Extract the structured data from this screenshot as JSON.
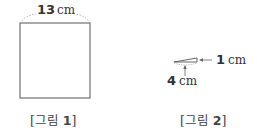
{
  "figure1": {
    "width_label_num": "13",
    "width_label_unit": "cm",
    "caption_open": "[그림 ",
    "caption_num": "1",
    "caption_close": "]"
  },
  "figure2": {
    "height_label_num": "1",
    "height_label_unit": "cm",
    "base_label_num": "4",
    "base_label_unit": "cm",
    "caption_open": "[그림 ",
    "caption_num": "2",
    "caption_close": "]"
  }
}
